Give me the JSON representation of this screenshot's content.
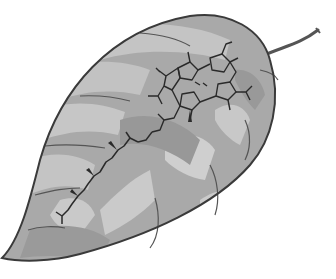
{
  "illustration": {
    "subject": "Leaf with chlorophyll molecule drawn on it",
    "colors": {
      "background": "#ffffff",
      "leaf_base": "#a9a9a9",
      "leaf_light": "#c4c4c4",
      "leaf_dark": "#8e8e8e",
      "outline": "#3a3a3a",
      "molecule": "#2a2a2a"
    }
  }
}
